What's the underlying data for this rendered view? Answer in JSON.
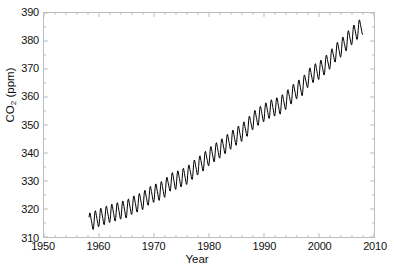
{
  "chart_data": {
    "type": "line",
    "title": "",
    "xlabel": "Year",
    "ylabel": "CO2 (ppm)",
    "ylabel_parts": {
      "prefix": "CO",
      "sub": "2",
      "suffix": " (ppm)"
    },
    "xlim": [
      1950,
      2010
    ],
    "ylim": [
      310,
      390
    ],
    "xticks": [
      1950,
      1960,
      1970,
      1980,
      1990,
      2000,
      2010
    ],
    "yticks": [
      310,
      320,
      330,
      340,
      350,
      360,
      370,
      380,
      390
    ],
    "grid": false,
    "legend": null,
    "line_color": "#000000",
    "frame_color": "#bdbdbd",
    "background": "#ffffff",
    "series": [
      {
        "name": "Mauna Loa monthly mean CO2",
        "description": "Monthly mean atmospheric CO2 concentration showing rising trend with annual seasonal oscillation of about 6 ppm peak-to-peak",
        "x_start": 1958.2,
        "x_end": 2008.0,
        "annual_cycle_amplitude_ppm": 3.0,
        "annual_values": [
          {
            "year": 1958,
            "value": 315.3
          },
          {
            "year": 1959,
            "value": 315.9
          },
          {
            "year": 1960,
            "value": 316.9
          },
          {
            "year": 1961,
            "value": 317.6
          },
          {
            "year": 1962,
            "value": 318.4
          },
          {
            "year": 1963,
            "value": 318.9
          },
          {
            "year": 1964,
            "value": 319.6
          },
          {
            "year": 1965,
            "value": 320.0
          },
          {
            "year": 1966,
            "value": 321.3
          },
          {
            "year": 1967,
            "value": 322.1
          },
          {
            "year": 1968,
            "value": 323.0
          },
          {
            "year": 1969,
            "value": 324.6
          },
          {
            "year": 1970,
            "value": 325.6
          },
          {
            "year": 1971,
            "value": 326.3
          },
          {
            "year": 1972,
            "value": 327.4
          },
          {
            "year": 1973,
            "value": 329.7
          },
          {
            "year": 1974,
            "value": 330.2
          },
          {
            "year": 1975,
            "value": 331.1
          },
          {
            "year": 1976,
            "value": 332.0
          },
          {
            "year": 1977,
            "value": 333.8
          },
          {
            "year": 1978,
            "value": 335.4
          },
          {
            "year": 1979,
            "value": 336.8
          },
          {
            "year": 1980,
            "value": 338.7
          },
          {
            "year": 1981,
            "value": 340.1
          },
          {
            "year": 1982,
            "value": 341.4
          },
          {
            "year": 1983,
            "value": 343.0
          },
          {
            "year": 1984,
            "value": 344.6
          },
          {
            "year": 1985,
            "value": 346.0
          },
          {
            "year": 1986,
            "value": 347.4
          },
          {
            "year": 1987,
            "value": 349.2
          },
          {
            "year": 1988,
            "value": 351.6
          },
          {
            "year": 1989,
            "value": 353.1
          },
          {
            "year": 1990,
            "value": 354.4
          },
          {
            "year": 1991,
            "value": 355.6
          },
          {
            "year": 1992,
            "value": 356.4
          },
          {
            "year": 1993,
            "value": 357.1
          },
          {
            "year": 1994,
            "value": 358.8
          },
          {
            "year": 1995,
            "value": 360.8
          },
          {
            "year": 1996,
            "value": 362.6
          },
          {
            "year": 1997,
            "value": 363.7
          },
          {
            "year": 1998,
            "value": 366.7
          },
          {
            "year": 1999,
            "value": 368.4
          },
          {
            "year": 2000,
            "value": 369.5
          },
          {
            "year": 2001,
            "value": 371.1
          },
          {
            "year": 2002,
            "value": 373.2
          },
          {
            "year": 2003,
            "value": 375.8
          },
          {
            "year": 2004,
            "value": 377.5
          },
          {
            "year": 2005,
            "value": 379.8
          },
          {
            "year": 2006,
            "value": 381.9
          },
          {
            "year": 2007,
            "value": 383.8
          },
          {
            "year": 2008,
            "value": 385.6
          }
        ]
      }
    ]
  }
}
